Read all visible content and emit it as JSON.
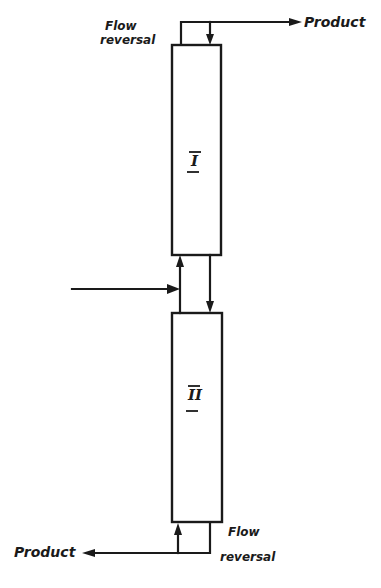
{
  "diagram": {
    "type": "process-flow",
    "columns": [
      {
        "id": "I",
        "label": "I"
      },
      {
        "id": "II",
        "label": "II"
      }
    ],
    "labels": {
      "top_product": "Product",
      "bottom_product": "Product",
      "top_flow_reversal_line1": "Flow",
      "top_flow_reversal_line2": "reversal",
      "bottom_flow_reversal_line1": "Flow",
      "bottom_flow_reversal_line2": "reversal"
    },
    "streams": [
      {
        "from": "feed (left)",
        "to": "between columns I and II"
      },
      {
        "from": "column II top",
        "to": "column I bottom",
        "direction": "up"
      },
      {
        "from": "column I bottom",
        "to": "column II top",
        "direction": "down"
      },
      {
        "from": "column I top",
        "to": "Product (top right)"
      },
      {
        "from": "flow reversal (top)",
        "to": "column I top",
        "direction": "down"
      },
      {
        "from": "flow reversal (bottom)",
        "to": "column II bottom",
        "direction": "up"
      },
      {
        "from": "column II bottom",
        "to": "Product (bottom left)"
      }
    ]
  }
}
